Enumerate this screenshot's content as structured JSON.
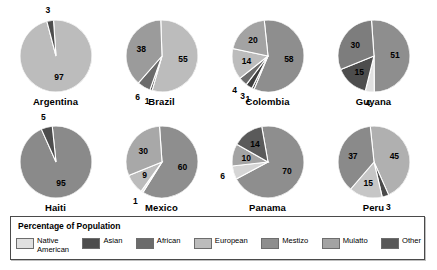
{
  "legend": {
    "title": "Percentage of Population",
    "items": [
      {
        "label": "Native\nAmerican",
        "key": "native_american",
        "color": "#e0e0e0"
      },
      {
        "label": "Asian",
        "key": "asian",
        "color": "#4d4d4d"
      },
      {
        "label": "African",
        "key": "african",
        "color": "#6b6b6b"
      },
      {
        "label": "European",
        "key": "european",
        "color": "#bcbcbc"
      },
      {
        "label": "Mestizo",
        "key": "mestizo",
        "color": "#8e8e8e"
      },
      {
        "label": "Mulatto",
        "key": "mulatto",
        "color": "#a3a3a3"
      },
      {
        "label": "Other",
        "key": "other",
        "color": "#585858"
      }
    ]
  },
  "chart_data": {
    "type": "pie",
    "title": "Percentage of Population",
    "legend_position": "bottom",
    "unit": "percent",
    "categories": [
      "Native American",
      "Asian",
      "African",
      "European",
      "Mestizo",
      "Mulatto",
      "Other"
    ],
    "charts": [
      {
        "name": "Argentina",
        "slices": [
          {
            "label": "97",
            "value": 97,
            "category": "European",
            "color": "#bcbcbc"
          },
          {
            "label": "3",
            "value": 3,
            "category": "Other",
            "color": "#4d4d4d"
          }
        ]
      },
      {
        "name": "Brazil",
        "slices": [
          {
            "label": "55",
            "value": 55,
            "category": "European",
            "color": "#bcbcbc"
          },
          {
            "label": "1",
            "value": 1,
            "category": "Other",
            "color": "#585858"
          },
          {
            "label": "6",
            "value": 6,
            "category": "African",
            "color": "#6b6b6b"
          },
          {
            "label": "38",
            "value": 38,
            "category": "Mulatto",
            "color": "#9b9b9b"
          }
        ]
      },
      {
        "name": "Colombia",
        "slices": [
          {
            "label": "58",
            "value": 58,
            "category": "Mestizo",
            "color": "#8e8e8e"
          },
          {
            "label": "1",
            "value": 1,
            "category": "Other",
            "color": "#4a4a4a"
          },
          {
            "label": "3",
            "value": 3,
            "category": "Native American",
            "color": "#3f3f3f"
          },
          {
            "label": "4",
            "value": 4,
            "category": "African",
            "color": "#6b6b6b"
          },
          {
            "label": "14",
            "value": 14,
            "category": "European",
            "color": "#bcbcbc"
          },
          {
            "label": "20",
            "value": 20,
            "category": "Mulatto",
            "color": "#a3a3a3"
          }
        ]
      },
      {
        "name": "Guyana",
        "slices": [
          {
            "label": "51",
            "value": 51,
            "category": "Asian",
            "color": "#8e8e8e"
          },
          {
            "label": "4",
            "value": 4,
            "category": "Native American",
            "color": "#e0e0e0"
          },
          {
            "label": "15",
            "value": 15,
            "category": "Other",
            "color": "#4d4d4d"
          },
          {
            "label": "30",
            "value": 30,
            "category": "African",
            "color": "#7d7d7d"
          }
        ]
      },
      {
        "name": "Haiti",
        "slices": [
          {
            "label": "95",
            "value": 95,
            "category": "African",
            "color": "#8a8a8a"
          },
          {
            "label": "5",
            "value": 5,
            "category": "Mulatto",
            "color": "#4d4d4d"
          }
        ]
      },
      {
        "name": "Mexico",
        "slices": [
          {
            "label": "60",
            "value": 60,
            "category": "Mestizo",
            "color": "#8e8e8e"
          },
          {
            "label": "1",
            "value": 1,
            "category": "Other",
            "color": "#e8e8e8"
          },
          {
            "label": "9",
            "value": 9,
            "category": "European",
            "color": "#bcbcbc"
          },
          {
            "label": "30",
            "value": 30,
            "category": "Native American",
            "color": "#a8a8a8"
          }
        ]
      },
      {
        "name": "Panama",
        "slices": [
          {
            "label": "70",
            "value": 70,
            "category": "Mestizo",
            "color": "#8e8e8e"
          },
          {
            "label": "6",
            "value": 6,
            "category": "Native American",
            "color": "#d5d5d5"
          },
          {
            "label": "10",
            "value": 10,
            "category": "Mulatto",
            "color": "#a3a3a3"
          },
          {
            "label": "14",
            "value": 14,
            "category": "African",
            "color": "#5a5a5a"
          }
        ]
      },
      {
        "name": "Peru",
        "slices": [
          {
            "label": "45",
            "value": 45,
            "category": "Native American",
            "color": "#b0b0b0"
          },
          {
            "label": "3",
            "value": 3,
            "category": "Other",
            "color": "#4a4a4a"
          },
          {
            "label": "15",
            "value": 15,
            "category": "European",
            "color": "#c6c6c6"
          },
          {
            "label": "37",
            "value": 37,
            "category": "Mestizo",
            "color": "#8a8a8a"
          }
        ]
      }
    ]
  }
}
